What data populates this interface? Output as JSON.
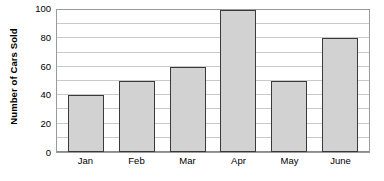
{
  "chart_data": {
    "type": "bar",
    "title": "",
    "xlabel": "",
    "ylabel": "Number of Cars Sold",
    "categories": [
      "Jan",
      "Feb",
      "Mar",
      "Apr",
      "May",
      "June"
    ],
    "values": [
      40,
      50,
      60,
      100,
      50,
      80
    ],
    "ylim": [
      0,
      100
    ],
    "y_ticks": [
      0,
      20,
      40,
      60,
      80,
      100
    ],
    "y_tick_labels": [
      "0",
      "20",
      "40",
      "60",
      "80",
      "100"
    ],
    "minor_gridline_step": 10,
    "grid": true,
    "legend": null,
    "bar_fill_color": "#d2d2d2",
    "bar_edge_color": "#3a3a3a",
    "gridline_color": "#c9c9c9",
    "frame_color": "#9a9a9a",
    "background_color": "#ffffff"
  }
}
